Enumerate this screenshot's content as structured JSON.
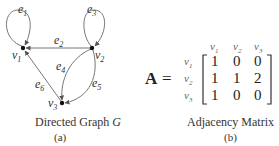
{
  "graph": {
    "caption": "Directed Graph ",
    "caption_var": "G",
    "sub_label": "(a)",
    "nodes": [
      {
        "id": "v1",
        "label": "v",
        "sub": "1"
      },
      {
        "id": "v2",
        "label": "v",
        "sub": "2"
      },
      {
        "id": "v3",
        "label": "v",
        "sub": "3"
      }
    ],
    "edges": [
      {
        "id": "e1",
        "label": "e",
        "sub": "1",
        "from": "v1",
        "to": "v1"
      },
      {
        "id": "e2",
        "label": "e",
        "sub": "2",
        "from": "v2",
        "to": "v1"
      },
      {
        "id": "e3",
        "label": "e",
        "sub": "3",
        "from": "v2",
        "to": "v2"
      },
      {
        "id": "e4",
        "label": "e",
        "sub": "4",
        "from": "v2",
        "to": "v3"
      },
      {
        "id": "e5",
        "label": "e",
        "sub": "5",
        "from": "v2",
        "to": "v3"
      },
      {
        "id": "e6",
        "label": "e",
        "sub": "6",
        "from": "v3",
        "to": "v1"
      }
    ]
  },
  "matrix": {
    "name": "A",
    "equals": "=",
    "col_headers": [
      {
        "label": "v",
        "sub": "1"
      },
      {
        "label": "v",
        "sub": "2"
      },
      {
        "label": "v",
        "sub": "3"
      }
    ],
    "row_headers": [
      {
        "label": "v",
        "sub": "1"
      },
      {
        "label": "v",
        "sub": "2"
      },
      {
        "label": "v",
        "sub": "3"
      }
    ],
    "rows": [
      [
        "1",
        "0",
        "0"
      ],
      [
        "1",
        "1",
        "2"
      ],
      [
        "1",
        "0",
        "0"
      ]
    ],
    "caption": "Adjacency Matrix",
    "sub_label": "(b)"
  }
}
